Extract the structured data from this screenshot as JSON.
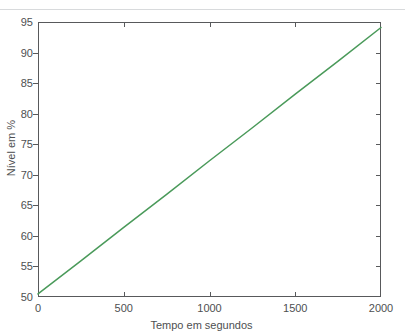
{
  "figure": {
    "background_color": "#ffffff",
    "rule_color": "#d8dadc",
    "axis_color": "#58595b",
    "text_color": "#4e4f51"
  },
  "chart_data": {
    "type": "line",
    "title": "",
    "xlabel": "Tempo em segundos",
    "ylabel": "Nível em %",
    "xlim": [
      0,
      2000
    ],
    "ylim": [
      50,
      95
    ],
    "xticks": [
      0,
      500,
      1000,
      1500,
      2000
    ],
    "yticks": [
      50,
      55,
      60,
      65,
      70,
      75,
      80,
      85,
      90,
      95
    ],
    "xtick_labels": [
      "0",
      "500",
      "1000",
      "1500",
      "2000"
    ],
    "ytick_labels": [
      "50",
      "55",
      "60",
      "65",
      "70",
      "75",
      "80",
      "85",
      "90",
      "95"
    ],
    "grid": false,
    "legend": null,
    "series": [
      {
        "name": "Nível",
        "color": "#4a9a5a",
        "line_width": 1.5,
        "x": [
          0,
          250,
          500,
          750,
          1000,
          1250,
          1500,
          1750,
          2000
        ],
        "y": [
          50.5,
          55.9,
          61.4,
          66.8,
          72.3,
          77.7,
          83.2,
          88.6,
          94.1
        ]
      }
    ]
  }
}
